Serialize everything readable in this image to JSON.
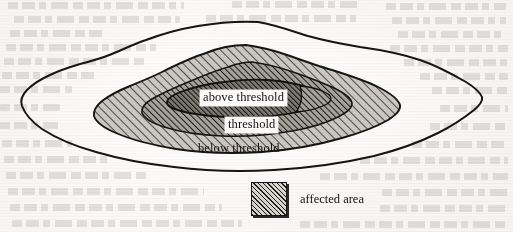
{
  "figure": {
    "kind": "contour-region-diagram",
    "background_note": "scanned book page with faint bleed-through text",
    "regions": [
      {
        "id": "below-threshold",
        "label": "below threshold",
        "fill": "none",
        "outline_color": "#171512",
        "description": "outermost irregular contour, unfilled white interior"
      },
      {
        "id": "threshold",
        "label": "threshold",
        "fill": "diagonal-hatch-light",
        "fill_color": "#c9c6c1",
        "outline_color": "#171512",
        "description": "middle ring with 45 degree hatching"
      },
      {
        "id": "above-threshold",
        "label": "above threshold",
        "fill": "diagonal-hatch-dark",
        "fill_color": "#8e8b86",
        "outline_color": "#14120f",
        "description": "innermost elongated lens-shaped region, darkest hatching"
      }
    ],
    "legend": {
      "swatch_name": "hatched-square",
      "swatch_fill": "#d7d4cf",
      "swatch_border": "#171512",
      "label": "affected area"
    }
  }
}
